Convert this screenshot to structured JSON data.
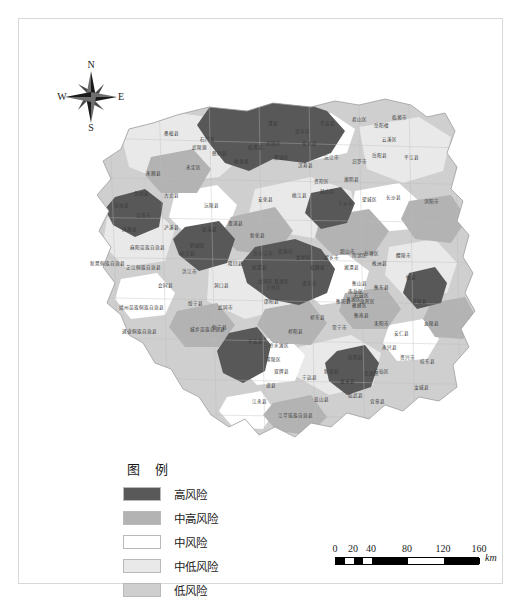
{
  "figure": {
    "kind": "choropleth-risk-map",
    "region": "Hunan"
  },
  "compass": {
    "north": "N",
    "east": "E",
    "south": "S",
    "west": "W"
  },
  "legend": {
    "title": "图 例",
    "items": [
      {
        "label": "高风险",
        "color": "#595959"
      },
      {
        "label": "中高风险",
        "color": "#b3b3b3"
      },
      {
        "label": "中风险",
        "color": "#ffffff"
      },
      {
        "label": "中低风险",
        "color": "#e9e9e9"
      },
      {
        "label": "低风险",
        "color": "#cfcfcf"
      }
    ]
  },
  "scalebar": {
    "ticks": [
      "0",
      "20",
      "40",
      "80",
      "120",
      "160"
    ],
    "unit": "km"
  },
  "map": {
    "labels": [
      {
        "t": "石门县",
        "x": 148,
        "y": 44
      },
      {
        "t": "临澧县",
        "x": 196,
        "y": 52
      },
      {
        "t": "澧县",
        "x": 214,
        "y": 28
      },
      {
        "t": "津市市",
        "x": 243,
        "y": 36
      },
      {
        "t": "安乡县",
        "x": 250,
        "y": 48
      },
      {
        "t": "华容县",
        "x": 268,
        "y": 28
      },
      {
        "t": "君山区",
        "x": 300,
        "y": 24
      },
      {
        "t": "岳阳楼",
        "x": 322,
        "y": 30
      },
      {
        "t": "临湘市",
        "x": 340,
        "y": 22
      },
      {
        "t": "云溪区",
        "x": 330,
        "y": 44
      },
      {
        "t": "岳阳县",
        "x": 320,
        "y": 60
      },
      {
        "t": "平江县",
        "x": 352,
        "y": 62
      },
      {
        "t": "汨罗市",
        "x": 300,
        "y": 66
      },
      {
        "t": "湘阴县",
        "x": 292,
        "y": 84
      },
      {
        "t": "桃源县",
        "x": 182,
        "y": 66
      },
      {
        "t": "鼎城区",
        "x": 222,
        "y": 62
      },
      {
        "t": "汉寿县",
        "x": 246,
        "y": 70
      },
      {
        "t": "沅江市",
        "x": 272,
        "y": 62
      },
      {
        "t": "武陵区",
        "x": 214,
        "y": 48
      },
      {
        "t": "桑植县",
        "x": 112,
        "y": 38
      },
      {
        "t": "永定区",
        "x": 134,
        "y": 72
      },
      {
        "t": "慈利县",
        "x": 160,
        "y": 58
      },
      {
        "t": "武陵源",
        "x": 140,
        "y": 52
      },
      {
        "t": "永顺县",
        "x": 94,
        "y": 78
      },
      {
        "t": "桃江县",
        "x": 240,
        "y": 100
      },
      {
        "t": "安化县",
        "x": 206,
        "y": 104
      },
      {
        "t": "赫山区",
        "x": 268,
        "y": 96
      },
      {
        "t": "资阳区",
        "x": 262,
        "y": 86
      },
      {
        "t": "宁乡市",
        "x": 286,
        "y": 108
      },
      {
        "t": "望城区",
        "x": 310,
        "y": 104
      },
      {
        "t": "长沙县",
        "x": 334,
        "y": 102
      },
      {
        "t": "浏阳市",
        "x": 372,
        "y": 106
      },
      {
        "t": "保靖县",
        "x": 82,
        "y": 98
      },
      {
        "t": "古丈县",
        "x": 112,
        "y": 100
      },
      {
        "t": "花垣县",
        "x": 62,
        "y": 110
      },
      {
        "t": "吉首市",
        "x": 84,
        "y": 120
      },
      {
        "t": "沅陵县",
        "x": 152,
        "y": 110
      },
      {
        "t": "辰溪县",
        "x": 150,
        "y": 134
      },
      {
        "t": "泸溪县",
        "x": 112,
        "y": 132
      },
      {
        "t": "溆浦县",
        "x": 176,
        "y": 128
      },
      {
        "t": "凤凰县",
        "x": 70,
        "y": 134
      },
      {
        "t": "麻阳苗族自治县",
        "x": 88,
        "y": 152
      },
      {
        "t": "中方县",
        "x": 128,
        "y": 158
      },
      {
        "t": "鹤城区",
        "x": 138,
        "y": 150
      },
      {
        "t": "芷江侗族自治县",
        "x": 84,
        "y": 172
      },
      {
        "t": "新晃侗族自治县",
        "x": 48,
        "y": 168
      },
      {
        "t": "洪江市",
        "x": 130,
        "y": 176
      },
      {
        "t": "会同县",
        "x": 106,
        "y": 190
      },
      {
        "t": "靖州苗族侗族自治县",
        "x": 82,
        "y": 212
      },
      {
        "t": "通道侗族自治县",
        "x": 80,
        "y": 236
      },
      {
        "t": "绥宁县",
        "x": 136,
        "y": 208
      },
      {
        "t": "城步苗族自治县",
        "x": 148,
        "y": 234
      },
      {
        "t": "新化县",
        "x": 198,
        "y": 140
      },
      {
        "t": "冷水江市",
        "x": 204,
        "y": 158
      },
      {
        "t": "涟源市",
        "x": 226,
        "y": 156
      },
      {
        "t": "娄星区",
        "x": 244,
        "y": 162
      },
      {
        "t": "双峰县",
        "x": 258,
        "y": 172
      },
      {
        "t": "新邵县",
        "x": 200,
        "y": 172
      },
      {
        "t": "邵东市",
        "x": 250,
        "y": 188
      },
      {
        "t": "双清区",
        "x": 222,
        "y": 186
      },
      {
        "t": "大祥区",
        "x": 214,
        "y": 192
      },
      {
        "t": "北塔区",
        "x": 206,
        "y": 186
      },
      {
        "t": "邵阳县",
        "x": 212,
        "y": 206
      },
      {
        "t": "隆回县",
        "x": 176,
        "y": 168
      },
      {
        "t": "洞口县",
        "x": 162,
        "y": 190
      },
      {
        "t": "武冈市",
        "x": 166,
        "y": 212
      },
      {
        "t": "新宁县",
        "x": 160,
        "y": 232
      },
      {
        "t": "湘乡市",
        "x": 272,
        "y": 162
      },
      {
        "t": "韶山市",
        "x": 288,
        "y": 156
      },
      {
        "t": "湘潭县",
        "x": 292,
        "y": 172
      },
      {
        "t": "雨湖区",
        "x": 300,
        "y": 160
      },
      {
        "t": "岳塘区",
        "x": 312,
        "y": 158
      },
      {
        "t": "株洲县",
        "x": 320,
        "y": 168
      },
      {
        "t": "醴陵市",
        "x": 344,
        "y": 160
      },
      {
        "t": "攸县",
        "x": 352,
        "y": 182
      },
      {
        "t": "茶陵县",
        "x": 360,
        "y": 206
      },
      {
        "t": "炎陵县",
        "x": 372,
        "y": 228
      },
      {
        "t": "衡山县",
        "x": 300,
        "y": 188
      },
      {
        "t": "衡东县",
        "x": 322,
        "y": 192
      },
      {
        "t": "南岳区",
        "x": 296,
        "y": 196
      },
      {
        "t": "衡阳县",
        "x": 284,
        "y": 206
      },
      {
        "t": "蒸湘区",
        "x": 294,
        "y": 204
      },
      {
        "t": "石鼓区",
        "x": 302,
        "y": 200
      },
      {
        "t": "珠晖区",
        "x": 308,
        "y": 206
      },
      {
        "t": "雁峰区",
        "x": 300,
        "y": 210
      },
      {
        "t": "衡南县",
        "x": 302,
        "y": 220
      },
      {
        "t": "耒阳市",
        "x": 322,
        "y": 228
      },
      {
        "t": "常宁市",
        "x": 280,
        "y": 232
      },
      {
        "t": "祁东县",
        "x": 258,
        "y": 222
      },
      {
        "t": "祁阳县",
        "x": 236,
        "y": 236
      },
      {
        "t": "冷水滩区",
        "x": 220,
        "y": 250
      },
      {
        "t": "东安县",
        "x": 196,
        "y": 246
      },
      {
        "t": "零陵区",
        "x": 214,
        "y": 264
      },
      {
        "t": "双牌县",
        "x": 222,
        "y": 276
      },
      {
        "t": "道县",
        "x": 212,
        "y": 290
      },
      {
        "t": "宁远县",
        "x": 250,
        "y": 282
      },
      {
        "t": "新田县",
        "x": 272,
        "y": 276
      },
      {
        "t": "蓝山县",
        "x": 262,
        "y": 304
      },
      {
        "t": "江永县",
        "x": 200,
        "y": 306
      },
      {
        "t": "江华瑶族自治县",
        "x": 236,
        "y": 320
      },
      {
        "t": "桂阳县",
        "x": 296,
        "y": 262
      },
      {
        "t": "北湖区",
        "x": 312,
        "y": 278
      },
      {
        "t": "苏仙区",
        "x": 322,
        "y": 276
      },
      {
        "t": "永兴县",
        "x": 330,
        "y": 252
      },
      {
        "t": "资兴市",
        "x": 348,
        "y": 262
      },
      {
        "t": "安仁县",
        "x": 342,
        "y": 238
      },
      {
        "t": "嘉禾县",
        "x": 288,
        "y": 286
      },
      {
        "t": "临武县",
        "x": 296,
        "y": 300
      },
      {
        "t": "宜章县",
        "x": 318,
        "y": 306
      },
      {
        "t": "汝城县",
        "x": 362,
        "y": 292
      },
      {
        "t": "桂东县",
        "x": 368,
        "y": 266
      }
    ]
  }
}
